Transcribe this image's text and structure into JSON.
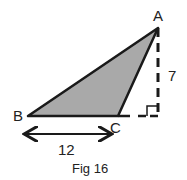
{
  "figure": {
    "caption": "Fig 16",
    "vertices": {
      "A": {
        "label": "A",
        "x": 158,
        "y": 28
      },
      "B": {
        "label": "B",
        "x": 28,
        "y": 116
      },
      "C": {
        "label": "C",
        "x": 118,
        "y": 116
      }
    },
    "foot": {
      "x": 158,
      "y": 116
    },
    "measurements": {
      "base_label": "12",
      "height_label": "7"
    },
    "colors": {
      "fill": "#a9a9a9",
      "stroke": "#1a1a1a"
    }
  }
}
